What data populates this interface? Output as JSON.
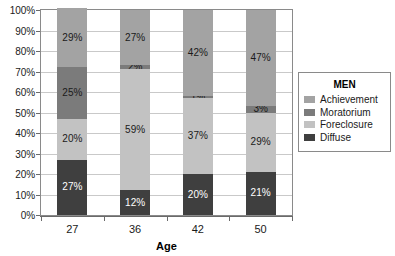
{
  "chart_data": {
    "type": "bar",
    "stacked": true,
    "stack_mode": "percent",
    "title": "",
    "xlabel": "Age",
    "ylabel": "",
    "ylim": [
      0,
      100
    ],
    "ytick_labels": [
      "0%",
      "10%",
      "20%",
      "30%",
      "40%",
      "50%",
      "60%",
      "70%",
      "80%",
      "90%",
      "100%"
    ],
    "ytick_values": [
      0,
      10,
      20,
      30,
      40,
      50,
      60,
      70,
      80,
      90,
      100
    ],
    "grid": true,
    "grid_axis": "y",
    "legend_position": "right",
    "legend_title": "MEN",
    "categories": [
      "27",
      "36",
      "42",
      "50"
    ],
    "series": [
      {
        "name": "Diffuse",
        "values": [
          27,
          12,
          20,
          21
        ],
        "color": "#3f3f3f",
        "label_color": "light"
      },
      {
        "name": "Foreclosure",
        "values": [
          20,
          59,
          37,
          29
        ],
        "color": "#c2c2c2",
        "label_color": "dark"
      },
      {
        "name": "Moratorium",
        "values": [
          25,
          2,
          1,
          3
        ],
        "color": "#7b7b7b",
        "label_color": "dark"
      },
      {
        "name": "Achievement",
        "values": [
          29,
          27,
          42,
          47
        ],
        "color": "#a3a3a3",
        "label_color": "dark"
      }
    ],
    "data_labels": {
      "27": {
        "Achievement": "29%",
        "Moratorium": "25%",
        "Foreclosure": "20%",
        "Diffuse": "27%"
      },
      "36": {
        "Achievement": "27%",
        "Moratorium": "2%",
        "Foreclosure": "59%",
        "Diffuse": "12%"
      },
      "42": {
        "Achievement": "42%",
        "Moratorium": "1%",
        "Foreclosure": "37%",
        "Diffuse": "20%"
      },
      "50": {
        "Achievement": "47%",
        "Moratorium": "3%",
        "Foreclosure": "29%",
        "Diffuse": "21%"
      }
    }
  },
  "legend": {
    "title": "MEN",
    "items": [
      {
        "label": "Achievement",
        "color": "#a3a3a3"
      },
      {
        "label": "Moratorium",
        "color": "#7b7b7b"
      },
      {
        "label": "Foreclosure",
        "color": "#c2c2c2"
      },
      {
        "label": "Diffuse",
        "color": "#3f3f3f"
      }
    ]
  },
  "axes": {
    "x_title": "Age",
    "x_categories": [
      "27",
      "36",
      "42",
      "50"
    ],
    "y_labels": [
      "100%",
      "90%",
      "80%",
      "70%",
      "60%",
      "50%",
      "40%",
      "30%",
      "20%",
      "10%",
      "0%"
    ]
  }
}
